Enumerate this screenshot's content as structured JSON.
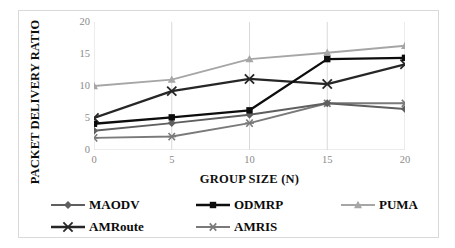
{
  "chart_data": {
    "type": "line",
    "title": "",
    "xlabel": "GROUP SIZE (N)",
    "ylabel": "PACKET DELIVERY RATIO",
    "x": [
      0,
      5,
      10,
      15,
      20
    ],
    "categories": [
      "0",
      "5",
      "10",
      "15",
      "20"
    ],
    "xticklabels": [
      "0",
      "5",
      "10",
      "15",
      "20"
    ],
    "yticklabels": [
      "0",
      "5",
      "10",
      "15",
      "20"
    ],
    "xlim": [
      0,
      20
    ],
    "ylim": [
      0,
      20
    ],
    "grid": "vertical-only",
    "legend_position": "bottom",
    "series": [
      {
        "name": "MAODV",
        "marker": "diamond",
        "color": "#5f5f5f",
        "values": [
          3.0,
          4.2,
          5.5,
          7.3,
          6.4
        ]
      },
      {
        "name": "ODMRP",
        "marker": "square",
        "color": "#0d0d0d",
        "values": [
          4.1,
          5.1,
          6.2,
          14.2,
          14.4
        ]
      },
      {
        "name": "PUMA",
        "marker": "triangle",
        "color": "#a6a6a6",
        "values": [
          10.0,
          11.0,
          14.2,
          15.2,
          16.3
        ]
      },
      {
        "name": "AMRoute",
        "marker": "x",
        "color": "#262626",
        "values": [
          5.0,
          9.2,
          11.1,
          10.3,
          13.4
        ]
      },
      {
        "name": "AMRIS",
        "marker": "asterisk",
        "color": "#7a7a7a",
        "values": [
          1.9,
          2.1,
          4.2,
          7.3,
          7.3
        ]
      }
    ]
  },
  "legend": {
    "rows": [
      [
        "MAODV",
        "ODMRP",
        "PUMA"
      ],
      [
        "AMRoute",
        "AMRIS"
      ]
    ]
  },
  "axes": {
    "x_title": "GROUP SIZE (N)",
    "y_title": "PACKET DELIVERY RATIO"
  },
  "colors": {
    "gridline": "#d9d9d9",
    "tick_text": "#8a8a8a",
    "title_text": "#0f0f0f",
    "frame": "#d9d9d9"
  }
}
